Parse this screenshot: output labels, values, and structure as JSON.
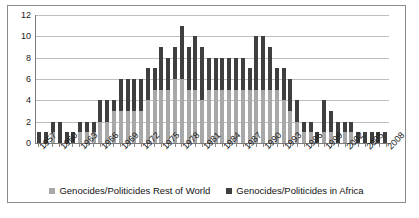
{
  "chart_data": {
    "type": "bar",
    "stacked": true,
    "title": "",
    "subtitle": "",
    "xlabel": "",
    "ylabel": "",
    "ylim": [
      0,
      12
    ],
    "ytick_step": 2,
    "ytick_labels": [
      "0",
      "2",
      "4",
      "6",
      "8",
      "10",
      "12"
    ],
    "grid": true,
    "legend_position": "bottom",
    "xtick_labels": [
      "1957",
      "1960",
      "1963",
      "1966",
      "1969",
      "1972",
      "1975",
      "1978",
      "1981",
      "1984",
      "1987",
      "1990",
      "1993",
      "1996",
      "1999",
      "2002",
      "2005",
      "2008"
    ],
    "xtick_interval": 3,
    "categories": [
      "1957",
      "1958",
      "1959",
      "1960",
      "1961",
      "1962",
      "1963",
      "1964",
      "1965",
      "1966",
      "1967",
      "1968",
      "1969",
      "1970",
      "1971",
      "1972",
      "1973",
      "1974",
      "1975",
      "1976",
      "1977",
      "1978",
      "1979",
      "1980",
      "1981",
      "1982",
      "1983",
      "1984",
      "1985",
      "1986",
      "1987",
      "1988",
      "1989",
      "1990",
      "1991",
      "1992",
      "1993",
      "1994",
      "1995",
      "1996",
      "1997",
      "1998",
      "1999",
      "2000",
      "2001",
      "2002",
      "2003",
      "2004",
      "2005",
      "2006",
      "2007",
      "2008"
    ],
    "series": [
      {
        "name": "Genocides/Politicides Rest of World",
        "color": "#a8a8a8",
        "values": [
          0,
          0,
          1,
          0,
          0,
          0,
          1,
          1,
          1,
          2,
          2,
          3,
          3,
          3,
          3,
          3,
          4,
          5,
          5,
          5,
          6,
          6,
          5,
          5,
          4,
          5,
          5,
          5,
          5,
          5,
          5,
          5,
          5,
          5,
          5,
          5,
          4,
          3,
          2,
          1,
          1,
          0,
          1,
          1,
          0,
          1,
          1,
          0,
          0,
          0,
          0,
          0
        ]
      },
      {
        "name": "Genocides/Politicides in Africa",
        "color": "#3f3f3f",
        "values": [
          1,
          1,
          1,
          2,
          1,
          1,
          1,
          1,
          1,
          2,
          2,
          1,
          3,
          3,
          3,
          3,
          3,
          2,
          4,
          3,
          3,
          5,
          4,
          5,
          5,
          3,
          3,
          3,
          3,
          3,
          3,
          2,
          5,
          5,
          4,
          2,
          3,
          3,
          2,
          1,
          1,
          1,
          3,
          2,
          2,
          1,
          1,
          1,
          1,
          1,
          1,
          1
        ]
      }
    ],
    "totals": [
      1,
      1,
      2,
      2,
      1,
      1,
      2,
      2,
      2,
      4,
      4,
      4,
      6,
      6,
      6,
      6,
      7,
      7,
      9,
      8,
      9,
      11,
      9,
      10,
      9,
      8,
      8,
      8,
      8,
      8,
      8,
      7,
      10,
      10,
      9,
      7,
      7,
      6,
      4,
      2,
      2,
      1,
      4,
      3,
      2,
      2,
      2,
      1,
      1,
      1,
      1,
      1
    ]
  },
  "legend": {
    "items": [
      {
        "label": "Genocides/Politicides Rest of World",
        "swatch": "world-swatch"
      },
      {
        "label": "Genocides/Politicides in Africa",
        "swatch": "africa-swatch"
      }
    ]
  },
  "colors": {
    "rest_of_world": "#a8a8a8",
    "in_africa": "#3f3f3f",
    "gridline": "#bfbfbf",
    "axis": "#7a7a7a",
    "frame_border": "#8c8c8c",
    "background": "#ffffff",
    "text": "#1a1a1a"
  }
}
